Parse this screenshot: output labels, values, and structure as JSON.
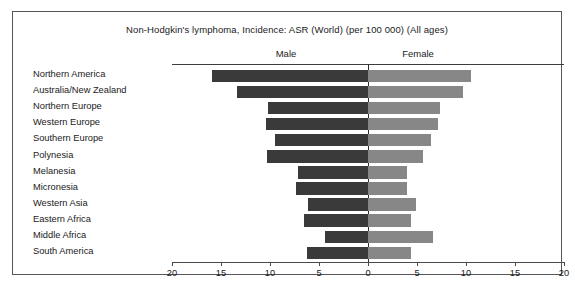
{
  "chart_data": {
    "type": "bar",
    "subtype": "diverging-population-pyramid",
    "title": "Non-Hodgkin's lymphoma, Incidence: ASR (World) (per 100 000) (All ages)",
    "xlabel": "",
    "ylabel": "",
    "xlim": [
      -20,
      20
    ],
    "x_ticks": [
      20,
      15,
      10,
      5,
      0,
      5,
      10,
      15,
      20
    ],
    "grid": false,
    "legend_position": "top",
    "categories": [
      "Northern America",
      "Australia/New Zealand",
      "Northern Europe",
      "Western Europe",
      "Southern Europe",
      "Polynesia",
      "Melanesia",
      "Micronesia",
      "Western Asia",
      "Eastern Africa",
      "Middle Africa",
      "South America"
    ],
    "series": [
      {
        "name": "Male",
        "side": "left",
        "color": "#3a3a3a",
        "values": [
          15.9,
          13.4,
          10.2,
          10.4,
          9.5,
          10.3,
          7.1,
          7.3,
          6.1,
          6.5,
          4.4,
          6.2
        ]
      },
      {
        "name": "Female",
        "side": "right",
        "color": "#878787",
        "values": [
          10.5,
          9.7,
          7.3,
          7.1,
          6.4,
          5.6,
          4.0,
          4.0,
          4.9,
          4.4,
          6.6,
          4.4
        ]
      }
    ]
  },
  "headers": {
    "male": "Male",
    "female": "Female"
  },
  "axis": {
    "unit_px": 9.8,
    "center_px": 355
  }
}
